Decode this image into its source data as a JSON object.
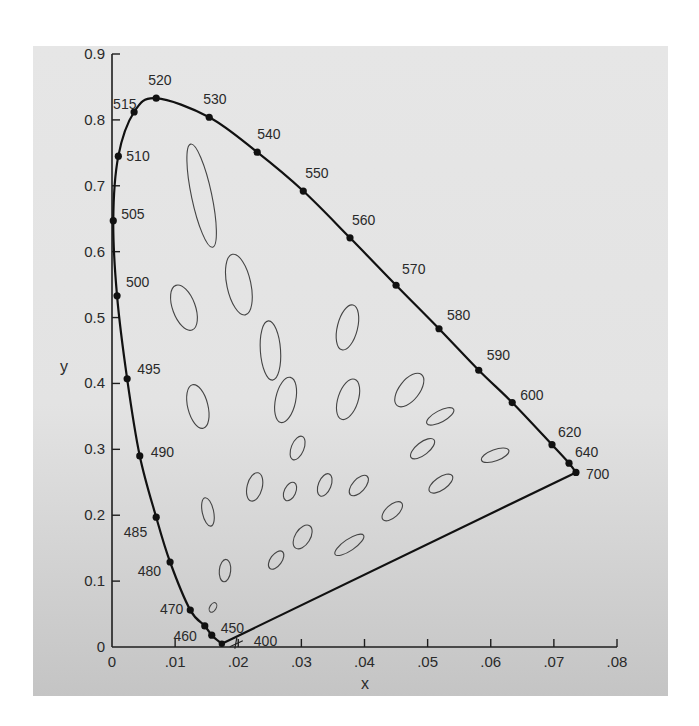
{
  "chart_data": {
    "type": "scatter",
    "title": "",
    "xlabel": "x",
    "ylabel": "y",
    "xlim": [
      0,
      0.08
    ],
    "ylim": [
      0,
      0.9
    ],
    "grid": false,
    "x_ticks": [
      "0",
      ".01",
      ".02",
      ".03",
      ".04",
      ".05",
      ".06",
      ".07",
      ".08"
    ],
    "y_ticks": [
      "0",
      "0.1",
      "0.2",
      "0.3",
      "0.4",
      "0.5",
      "0.6",
      "0.7",
      "0.8",
      "0.9"
    ],
    "spectral_locus": [
      {
        "label": "700",
        "x": 0.0735,
        "y": 0.265
      },
      {
        "label": "640",
        "x": 0.0724,
        "y": 0.279
      },
      {
        "label": "620",
        "x": 0.0697,
        "y": 0.307
      },
      {
        "label": "600",
        "x": 0.0634,
        "y": 0.371
      },
      {
        "label": "590",
        "x": 0.0581,
        "y": 0.42
      },
      {
        "label": "580",
        "x": 0.0518,
        "y": 0.483
      },
      {
        "label": "570",
        "x": 0.045,
        "y": 0.549
      },
      {
        "label": "560",
        "x": 0.0377,
        "y": 0.621
      },
      {
        "label": "550",
        "x": 0.0303,
        "y": 0.692
      },
      {
        "label": "540",
        "x": 0.023,
        "y": 0.751
      },
      {
        "label": "530",
        "x": 0.0154,
        "y": 0.804
      },
      {
        "label": "520",
        "x": 0.007,
        "y": 0.833
      },
      {
        "label": "515",
        "x": 0.0035,
        "y": 0.812
      },
      {
        "label": "510",
        "x": 0.001,
        "y": 0.745
      },
      {
        "label": "505",
        "x": 0.0002,
        "y": 0.647
      },
      {
        "label": "500",
        "x": 0.0008,
        "y": 0.533
      },
      {
        "label": "495",
        "x": 0.0024,
        "y": 0.407
      },
      {
        "label": "490",
        "x": 0.0044,
        "y": 0.29
      },
      {
        "label": "485",
        "x": 0.007,
        "y": 0.197
      },
      {
        "label": "480",
        "x": 0.0092,
        "y": 0.129
      },
      {
        "label": "470",
        "x": 0.0124,
        "y": 0.056
      },
      {
        "label": "460",
        "x": 0.0147,
        "y": 0.032
      },
      {
        "label": "450",
        "x": 0.0158,
        "y": 0.018
      },
      {
        "label": "400",
        "x": 0.0174,
        "y": 0.005
      }
    ],
    "ellipses": [
      {
        "cx": 0.0142,
        "cy": 0.685,
        "rx": 0.0016,
        "ry": 0.08,
        "rot": -12
      },
      {
        "cx": 0.0201,
        "cy": 0.55,
        "rx": 0.0019,
        "ry": 0.047,
        "rot": -12
      },
      {
        "cx": 0.0114,
        "cy": 0.515,
        "rx": 0.0018,
        "ry": 0.036,
        "rot": -20
      },
      {
        "cx": 0.0251,
        "cy": 0.45,
        "rx": 0.0016,
        "ry": 0.045,
        "rot": -4
      },
      {
        "cx": 0.0373,
        "cy": 0.485,
        "rx": 0.0016,
        "ry": 0.035,
        "rot": 14
      },
      {
        "cx": 0.0136,
        "cy": 0.365,
        "rx": 0.0016,
        "ry": 0.034,
        "rot": -14
      },
      {
        "cx": 0.0275,
        "cy": 0.375,
        "rx": 0.0016,
        "ry": 0.035,
        "rot": 12
      },
      {
        "cx": 0.0374,
        "cy": 0.376,
        "rx": 0.0016,
        "ry": 0.032,
        "rot": 18
      },
      {
        "cx": 0.0471,
        "cy": 0.39,
        "rx": 0.0016,
        "ry": 0.03,
        "rot": 38
      },
      {
        "cx": 0.0294,
        "cy": 0.302,
        "rx": 0.001,
        "ry": 0.019,
        "rot": 22
      },
      {
        "cx": 0.0337,
        "cy": 0.246,
        "rx": 0.001,
        "ry": 0.018,
        "rot": 22
      },
      {
        "cx": 0.052,
        "cy": 0.35,
        "rx": 0.0009,
        "ry": 0.023,
        "rot": 62
      },
      {
        "cx": 0.0492,
        "cy": 0.301,
        "rx": 0.001,
        "ry": 0.022,
        "rot": 52
      },
      {
        "cx": 0.0607,
        "cy": 0.291,
        "rx": 0.0009,
        "ry": 0.022,
        "rot": 70
      },
      {
        "cx": 0.0226,
        "cy": 0.243,
        "rx": 0.0012,
        "ry": 0.022,
        "rot": 14
      },
      {
        "cx": 0.0282,
        "cy": 0.236,
        "rx": 0.0009,
        "ry": 0.015,
        "rot": 25
      },
      {
        "cx": 0.0391,
        "cy": 0.245,
        "rx": 0.001,
        "ry": 0.019,
        "rot": 42
      },
      {
        "cx": 0.0152,
        "cy": 0.205,
        "rx": 0.0009,
        "ry": 0.022,
        "rot": -12
      },
      {
        "cx": 0.0302,
        "cy": 0.167,
        "rx": 0.0012,
        "ry": 0.02,
        "rot": 32
      },
      {
        "cx": 0.0444,
        "cy": 0.206,
        "rx": 0.001,
        "ry": 0.019,
        "rot": 48
      },
      {
        "cx": 0.0521,
        "cy": 0.248,
        "rx": 0.001,
        "ry": 0.021,
        "rot": 55
      },
      {
        "cx": 0.0376,
        "cy": 0.155,
        "rx": 0.0009,
        "ry": 0.026,
        "rot": 56
      },
      {
        "cx": 0.0179,
        "cy": 0.116,
        "rx": 0.0009,
        "ry": 0.017,
        "rot": 6
      },
      {
        "cx": 0.026,
        "cy": 0.132,
        "rx": 0.0009,
        "ry": 0.016,
        "rot": 36
      },
      {
        "cx": 0.016,
        "cy": 0.06,
        "rx": 0.0005,
        "ry": 0.008,
        "rot": 30
      }
    ],
    "annotations": [
      "MacAdam ellipses",
      "line of purples from 400 to 700"
    ]
  }
}
